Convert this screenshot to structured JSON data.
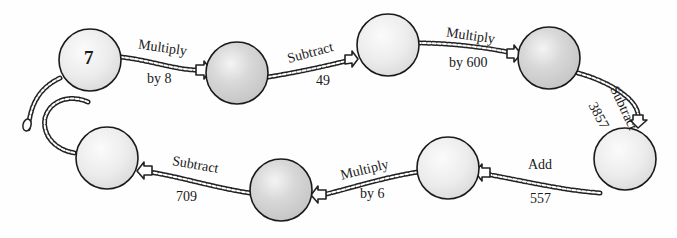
{
  "diagram": {
    "type": "number-chain",
    "start_value": "7",
    "nodes": [
      {
        "id": 1,
        "value": "7",
        "shade": "light"
      },
      {
        "id": 2,
        "value": "",
        "shade": "dark"
      },
      {
        "id": 3,
        "value": "",
        "shade": "light"
      },
      {
        "id": 4,
        "value": "",
        "shade": "dark"
      },
      {
        "id": 5,
        "value": "",
        "shade": "light"
      },
      {
        "id": 6,
        "value": "",
        "shade": "light"
      },
      {
        "id": 7,
        "value": "",
        "shade": "dark"
      },
      {
        "id": 8,
        "value": "",
        "shade": "light"
      }
    ],
    "operations": [
      {
        "from": 1,
        "to": 2,
        "line1": "Multiply",
        "line2": "by 8"
      },
      {
        "from": 2,
        "to": 3,
        "line1": "Subtract",
        "line2": "49"
      },
      {
        "from": 3,
        "to": 4,
        "line1": "Multiply",
        "line2": "by 600"
      },
      {
        "from": 4,
        "to": 5,
        "line1": "Subtract",
        "line2": "3857"
      },
      {
        "from": 5,
        "to": 6,
        "line1": "Add",
        "line2": "557"
      },
      {
        "from": 6,
        "to": 7,
        "line1": "Multiply",
        "line2": "by 6"
      },
      {
        "from": 7,
        "to": 8,
        "line1": "Subtract",
        "line2": "709"
      }
    ],
    "colors": {
      "light_fill": "#ececec",
      "dark_fill": "#d6d6d6",
      "outline": "#1a1a1a",
      "chain": "#222222"
    }
  }
}
